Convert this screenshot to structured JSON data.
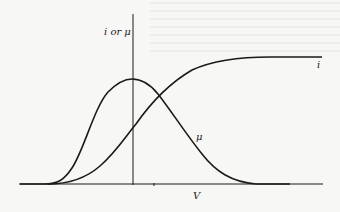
{
  "figure": {
    "y_axis_label": "i or μ",
    "x_axis_label": "V",
    "curves": [
      {
        "name": "i",
        "label": "i",
        "shape": "sigmoid (rises from zero and saturates to a plateau)"
      },
      {
        "name": "mu",
        "label": "μ",
        "shape": "bell-shaped, peak near V = 0"
      }
    ],
    "colors": {
      "background": "#f7f7f5",
      "ink": "#1a1a1a"
    }
  }
}
